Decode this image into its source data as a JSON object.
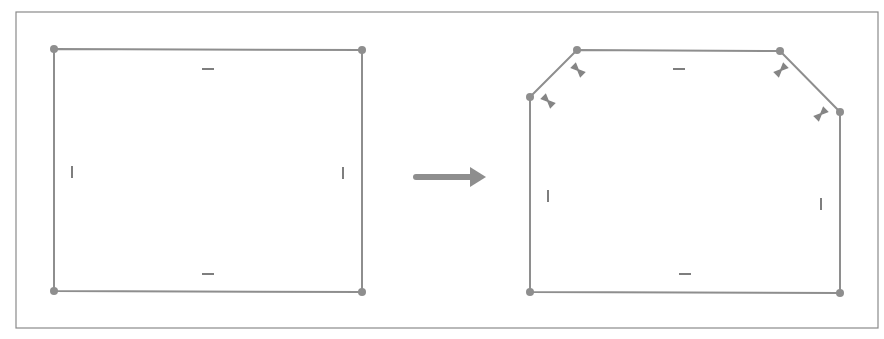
{
  "diagram": {
    "frame": {
      "x": 16,
      "y": 12,
      "w": 862,
      "h": 316
    },
    "colors": {
      "line": "#8e8e8e",
      "vertex": "#8e8e8e",
      "frame": "#8a8a8a",
      "background": "#ffffff"
    },
    "before": {
      "label": "rectangle-before",
      "vertices": [
        [
          54,
          49
        ],
        [
          362,
          50
        ],
        [
          362,
          292
        ],
        [
          54,
          291
        ]
      ],
      "horizontal_markers": [
        [
          208,
          69
        ],
        [
          208,
          274
        ]
      ],
      "vertical_markers": [
        [
          72,
          172
        ],
        [
          343,
          173
        ]
      ]
    },
    "arrow": {
      "x1": 416,
      "y1": 177,
      "x2": 486,
      "y2": 177
    },
    "after": {
      "label": "chamfered-polygon-after",
      "vertices": [
        [
          530,
          97
        ],
        [
          577,
          50
        ],
        [
          780,
          51
        ],
        [
          840,
          112
        ],
        [
          840,
          293
        ],
        [
          530,
          292
        ]
      ],
      "horizontal_markers": [
        [
          679,
          69
        ],
        [
          685,
          274
        ]
      ],
      "vertical_markers": [
        [
          548,
          196
        ],
        [
          821,
          204
        ]
      ],
      "bowtie_markers": [
        {
          "x": 548,
          "y": 101,
          "angle": 45
        },
        {
          "x": 578,
          "y": 70,
          "angle": 45
        },
        {
          "x": 781,
          "y": 70,
          "angle": -45
        },
        {
          "x": 821,
          "y": 114,
          "angle": -45
        }
      ]
    }
  }
}
